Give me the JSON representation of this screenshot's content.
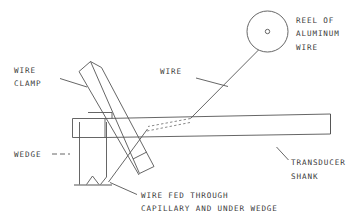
{
  "figure": {
    "kind": "technical-line-drawing",
    "stroke_color": "#555555",
    "background_color": "#ffffff",
    "width": 364,
    "height": 220
  },
  "labels": {
    "reel": {
      "line1": "REEL OF",
      "line2": "ALUMINUM",
      "line3": "WIRE"
    },
    "wire": {
      "line1": "WIRE"
    },
    "wire_clamp": {
      "line1": "WIRE",
      "line2": "CLAMP"
    },
    "wedge": {
      "line1": "WEDGE"
    },
    "transducer_shank": {
      "line1": "TRANSDUCER",
      "line2": "SHANK"
    },
    "wire_fed": {
      "line1": "WIRE FED THROUGH",
      "line2": "CAPILLARY AND UNDER WEDGE"
    }
  },
  "parts": [
    {
      "id": "reel-of-aluminum-wire",
      "shape": "circle-with-hub"
    },
    {
      "id": "aluminum-wire-strand",
      "shape": "line"
    },
    {
      "id": "wire-clamp",
      "shape": "slanted-bar"
    },
    {
      "id": "transducer-shank",
      "shape": "tapered-bar"
    },
    {
      "id": "capillary-channel",
      "shape": "dashed-double-line"
    },
    {
      "id": "wedge",
      "shape": "vertical-block-with-notch"
    },
    {
      "id": "substrate",
      "shape": "baseline"
    }
  ]
}
